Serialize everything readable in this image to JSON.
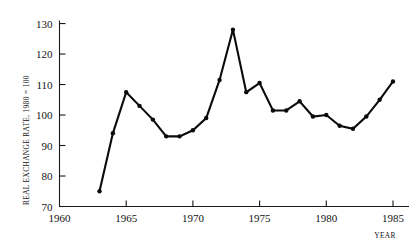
{
  "chart_data": {
    "type": "line",
    "title": "",
    "xlabel": "YEAR",
    "ylabel": "REAL EXCHANGE RATE, 1980 = 100",
    "xlim": [
      1960,
      1986.2
    ],
    "ylim": [
      70,
      131
    ],
    "xticks": [
      1960,
      1965,
      1970,
      1975,
      1980,
      1985
    ],
    "xticklabels": [
      "1960",
      "1965",
      "1970",
      "1975",
      "1980",
      "1985"
    ],
    "yticks": [
      70,
      80,
      90,
      100,
      110,
      120,
      130
    ],
    "yticklabels": [
      "70",
      "80",
      "90",
      "100",
      "110",
      "120",
      "130"
    ],
    "grid": false,
    "legend": false,
    "marker": "filled-circle",
    "line_color": "#0b0b0b",
    "x": [
      1963,
      1964,
      1965,
      1966,
      1967,
      1968,
      1969,
      1970,
      1971,
      1972,
      1973,
      1974,
      1975,
      1976,
      1977,
      1978,
      1979,
      1980,
      1981,
      1982,
      1983,
      1984,
      1985
    ],
    "values": [
      75.0,
      94.0,
      107.5,
      103.0,
      98.5,
      93.0,
      93.0,
      95.0,
      99.0,
      111.5,
      128.0,
      107.5,
      110.5,
      101.5,
      101.5,
      104.5,
      99.5,
      100.0,
      96.5,
      95.5,
      99.5,
      105.0,
      111.0
    ],
    "series": [
      {
        "name": "Real exchange rate",
        "values": [
          75.0,
          94.0,
          107.5,
          103.0,
          98.5,
          93.0,
          93.0,
          95.0,
          99.0,
          111.5,
          128.0,
          107.5,
          110.5,
          101.5,
          101.5,
          104.5,
          99.5,
          100.0,
          96.5,
          95.5,
          99.5,
          105.0,
          111.0
        ]
      }
    ]
  }
}
